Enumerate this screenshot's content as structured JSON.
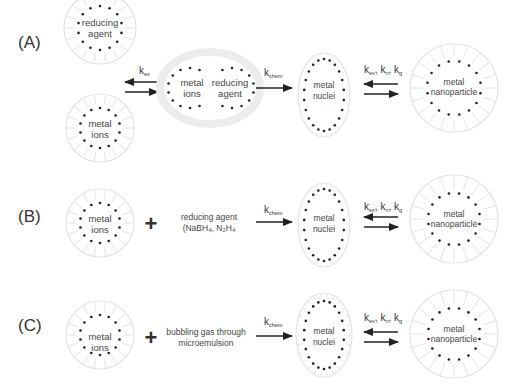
{
  "figure": {
    "rows": [
      {
        "panel_label": "(A)",
        "reactants": [
          {
            "label_lines": [
              "reducing",
              "agent"
            ]
          },
          {
            "label_lines": [
              "metal",
              "ions"
            ]
          }
        ],
        "step1_rate": {
          "base": "k",
          "sub": "ex"
        },
        "intermediate": {
          "label_lines_left": [
            "metal",
            "ions"
          ],
          "label_lines_right": [
            "reducing",
            "agent"
          ]
        },
        "step2_rate": {
          "base": "k",
          "sub": "chem"
        },
        "nuclei": {
          "label_lines": [
            "metal",
            "nuclei"
          ]
        },
        "step3_rate": [
          {
            "base": "k",
            "sub": "ex"
          },
          {
            "base": "k",
            "sub": "n"
          },
          {
            "base": "k",
            "sub": "g"
          }
        ],
        "product": {
          "label_lines": [
            "metal",
            "nanoparticle"
          ]
        }
      },
      {
        "panel_label": "(B)",
        "reactant": {
          "label_lines": [
            "metal",
            "ions"
          ]
        },
        "plus": "+",
        "reagent_lines": [
          "reducing agent",
          "(NaBH₄, N₂H₄"
        ],
        "step2_rate": {
          "base": "k",
          "sub": "chem"
        },
        "nuclei": {
          "label_lines": [
            "metal",
            "nuclei"
          ]
        },
        "step3_rate": [
          {
            "base": "k",
            "sub": "ex"
          },
          {
            "base": "k",
            "sub": "n"
          },
          {
            "base": "k",
            "sub": "g"
          }
        ],
        "product": {
          "label_lines": [
            "metal",
            "nanoparticle"
          ]
        }
      },
      {
        "panel_label": "(C)",
        "reactant": {
          "label_lines": [
            "metal",
            "ions"
          ]
        },
        "plus": "+",
        "reagent_lines": [
          "bubbling gas through",
          "microemulsion"
        ],
        "step2_rate": {
          "base": "k",
          "sub": "chem"
        },
        "nuclei": {
          "label_lines": [
            "metal",
            "nuclei"
          ]
        },
        "step3_rate": [
          {
            "base": "k",
            "sub": "ex"
          },
          {
            "base": "k",
            "sub": "n"
          },
          {
            "base": "k",
            "sub": "g"
          }
        ],
        "product": {
          "label_lines": [
            "metal",
            "nanoparticle"
          ]
        }
      }
    ],
    "colors": {
      "dots": "#222222",
      "halo": "#e4e4e4",
      "arrow": "#222222",
      "text": "#444444"
    }
  }
}
